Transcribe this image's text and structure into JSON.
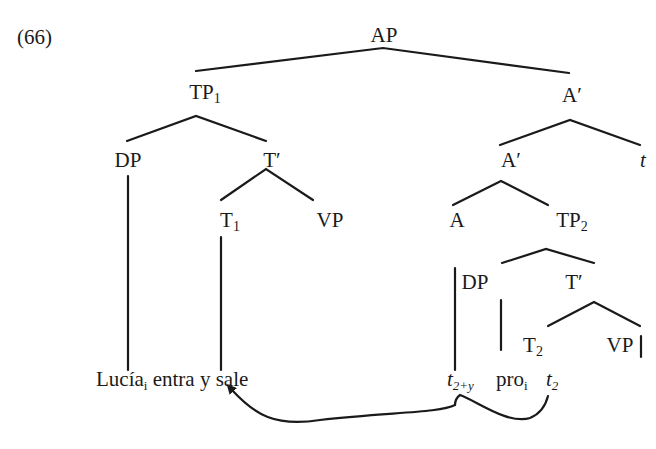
{
  "example_number": "(66)",
  "tree": {
    "root": "AP",
    "nodes": {
      "tp1": {
        "label": "TP",
        "sub": "1"
      },
      "a_bar_1": {
        "label": "A",
        "prime": true
      },
      "dp1": {
        "label": "DP"
      },
      "t_bar_1": {
        "label": "T",
        "prime": true
      },
      "t1": {
        "label": "T",
        "sub": "1"
      },
      "vp1": {
        "label": "VP"
      },
      "a_bar_2": {
        "label": "A",
        "prime": true
      },
      "t_trace_top": {
        "label": "t"
      },
      "a": {
        "label": "A"
      },
      "tp2": {
        "label": "TP",
        "sub": "2"
      },
      "dp2": {
        "label": "DP"
      },
      "t_bar_2": {
        "label": "T",
        "prime": true
      },
      "t2": {
        "label": "T",
        "sub": "2"
      },
      "vp2": {
        "label": "VP"
      }
    }
  },
  "terminals": {
    "lucia": {
      "text": "Lucía",
      "sub": "i"
    },
    "verbs": "entra y sale",
    "trace_2y": {
      "text": "t",
      "sub": "2+y"
    },
    "pro": {
      "text": "pro",
      "sub": "i"
    },
    "trace_2": {
      "text": "t",
      "sub": "2"
    }
  },
  "arrow": {
    "from": "t2 / t2+y",
    "to": "entra y sale",
    "color": "#1a1a1a"
  }
}
